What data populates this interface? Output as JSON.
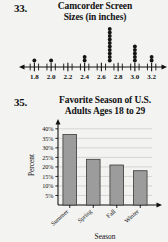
{
  "page": {
    "background_color": "#f3f3f1",
    "ink_color": "#111111"
  },
  "problem33": {
    "number": "33.",
    "title_line1": "Camcorder Screen",
    "title_line2": "Sizes (in inches)",
    "chart_data": {
      "type": "scatter",
      "plot_style": "dot-plot",
      "title": "Camcorder Screen Sizes (in inches)",
      "xlabel": "",
      "ylabel": "",
      "xlim": [
        1.7,
        3.3
      ],
      "grid": false,
      "legend": null,
      "tick_labels": [
        "1.8",
        "2.0",
        "2.2",
        "2.4",
        "2.6",
        "2.8",
        "3.0",
        "3.2"
      ],
      "tick_values": [
        1.8,
        2.0,
        2.2,
        2.4,
        2.6,
        2.8,
        3.0,
        3.2
      ],
      "minor_tick_step": 0.1,
      "x": [
        1.8,
        2.0,
        2.4,
        2.7,
        3.0,
        3.2
      ],
      "counts": [
        1,
        1,
        2,
        10,
        5,
        2
      ],
      "values": [
        1,
        1,
        2,
        10,
        5,
        2
      ],
      "categories": [
        "1.8",
        "2.0",
        "2.4",
        "2.7",
        "3.0",
        "3.2"
      ],
      "dot_color": "#151515",
      "axis_color": "#111111"
    }
  },
  "problem35": {
    "number": "35.",
    "title_line1": "Favorite Season of U.S.",
    "title_line2": "Adults Ages 18 to 29",
    "chart_data": {
      "type": "bar",
      "title": "Favorite Season of U.S. Adults Ages 18 to 29",
      "xlabel": "Season",
      "ylabel": "Percent",
      "categories": [
        "Summer",
        "Spring",
        "Fall",
        "Winter"
      ],
      "values": [
        37,
        24,
        21,
        18
      ],
      "ylim": [
        0,
        42
      ],
      "ytick_labels": [
        "5%",
        "10%",
        "15%",
        "20%",
        "25%",
        "30%",
        "35%",
        "40%"
      ],
      "ytick_values": [
        5,
        10,
        15,
        20,
        25,
        30,
        35,
        40
      ],
      "grid": true,
      "grid_orientation": "horizontal",
      "legend": null,
      "bar_fill": "#9c9c9c",
      "bar_stroke": "#3a3a3a",
      "grid_color": "#c9c9c9",
      "axis_color": "#111111"
    }
  }
}
